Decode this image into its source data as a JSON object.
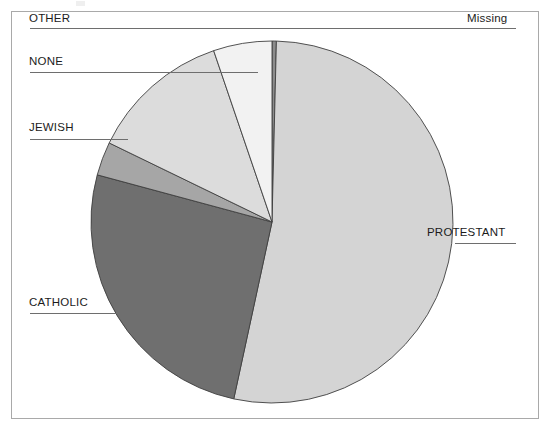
{
  "chart_data": {
    "type": "pie",
    "title": "",
    "subtitle": "",
    "xlabel": "",
    "ylabel": "",
    "grid": false,
    "legend_position": "none",
    "label_style": "leader-lines",
    "start_angle_deg": 0,
    "direction": "clockwise",
    "center": {
      "x": 272,
      "y": 222
    },
    "radius": 181,
    "categories": [
      "Missing",
      "PROTESTANT",
      "CATHOLIC",
      "JEWISH",
      "NONE",
      "OTHER"
    ],
    "values": [
      0.4,
      53.0,
      25.8,
      3.0,
      12.6,
      5.2
    ],
    "slices": [
      {
        "label": "Missing",
        "percent": 0.4,
        "start_deg": 0.0,
        "end_deg": 1.4,
        "color": "#8c8c8c",
        "label_side": "right",
        "label_case": "mixed"
      },
      {
        "label": "PROTESTANT",
        "percent": 53.0,
        "start_deg": 1.4,
        "end_deg": 192.2,
        "color": "#d4d4d4",
        "label_side": "right",
        "label_case": "upper"
      },
      {
        "label": "CATHOLIC",
        "percent": 25.8,
        "start_deg": 192.2,
        "end_deg": 285.1,
        "color": "#6f6f6f",
        "label_side": "left",
        "label_case": "upper"
      },
      {
        "label": "JEWISH",
        "percent": 3.0,
        "start_deg": 285.1,
        "end_deg": 295.9,
        "color": "#a6a6a6",
        "label_side": "left",
        "label_case": "upper"
      },
      {
        "label": "NONE",
        "percent": 12.6,
        "start_deg": 295.9,
        "end_deg": 341.2,
        "color": "#dcdcdc",
        "label_side": "left",
        "label_case": "upper"
      },
      {
        "label": "OTHER",
        "percent": 5.2,
        "start_deg": 341.2,
        "end_deg": 360.0,
        "color": "#f2f2f2",
        "label_side": "left",
        "label_case": "upper"
      }
    ]
  },
  "labels": {
    "other": "OTHER",
    "none": "NONE",
    "jewish": "JEWISH",
    "catholic": "CATHOLIC",
    "missing": "Missing",
    "protestant": "PROTESTANT"
  },
  "style": {
    "frame_color": "#a9a9a9",
    "leader_color": "#6e6e6e",
    "slice_outline": "#404040",
    "background": "#ffffff",
    "text_color": "#1c1c1c"
  }
}
